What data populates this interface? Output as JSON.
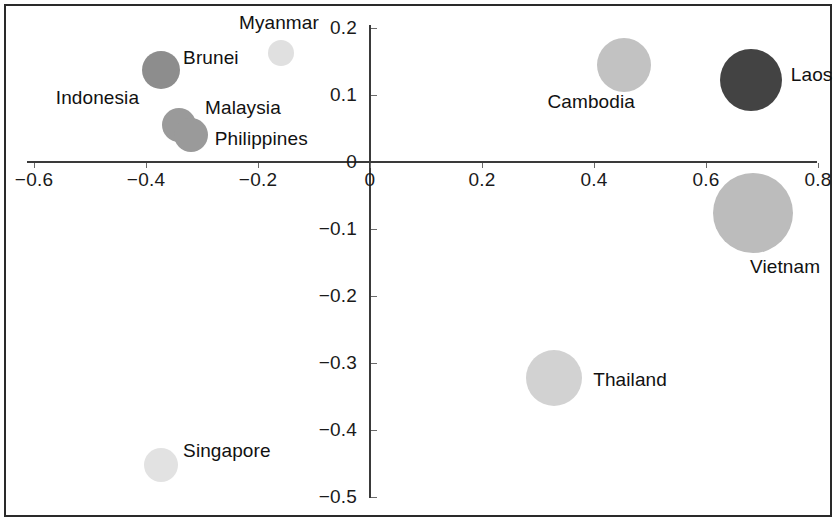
{
  "chart_data": {
    "type": "scatter",
    "title": "",
    "subtitle": "",
    "xlabel": "",
    "ylabel": "",
    "xlim": [
      -0.7,
      0.84
    ],
    "ylim": [
      -0.53,
      0.23
    ],
    "grid": false,
    "legend": "none",
    "xticks": [
      "-0.6",
      "-0.4",
      "-0.2",
      "0",
      "0.2",
      "0.4",
      "0.6",
      "0.8"
    ],
    "xtick_values": [
      -0.6,
      -0.4,
      -0.2,
      0,
      0.2,
      0.4,
      0.6,
      0.8
    ],
    "yticks": [
      "0.2",
      "0.1",
      "0",
      "-0.1",
      "-0.2",
      "-0.3",
      "-0.4",
      "-0.5"
    ],
    "ytick_values": [
      0.2,
      0.1,
      0,
      -0.1,
      -0.2,
      -0.3,
      -0.4,
      -0.5
    ],
    "origin_labels": {
      "x_zero": "0",
      "y_zero": "0"
    },
    "points": [
      {
        "name": "Indonesia",
        "x": -0.373,
        "y": 0.137,
        "size": 19,
        "color": "#8d8d8d",
        "label": "Indonesia",
        "label_anchor": "left",
        "label_dx": -22,
        "label_dy": 28
      },
      {
        "name": "Brunei",
        "x": -0.373,
        "y": 0.137,
        "size": 0,
        "color": "#8d8d8d",
        "label": "Brunei",
        "label_anchor": "right",
        "label_dx": 22,
        "label_dy": -12
      },
      {
        "name": "Myanmar",
        "x": -0.159,
        "y": 0.163,
        "size": 13,
        "color": "#e0e0e0",
        "label": "Myanmar",
        "label_anchor": "center",
        "label_dx": -2,
        "label_dy": -30
      },
      {
        "name": "Malaysia",
        "x": -0.341,
        "y": 0.055,
        "size": 17,
        "color": "#9a9a9a",
        "label": "Malaysia",
        "label_anchor": "right",
        "label_dx": 26,
        "label_dy": -17
      },
      {
        "name": "Philippines",
        "x": -0.32,
        "y": 0.04,
        "size": 17,
        "color": "#9a9a9a",
        "label": "Philippines",
        "label_anchor": "right",
        "label_dx": 24,
        "label_dy": 4
      },
      {
        "name": "Cambodia",
        "x": 0.454,
        "y": 0.145,
        "size": 27,
        "color": "#c2c2c2",
        "label": "Cambodia",
        "label_anchor": "center",
        "label_dx": -33,
        "label_dy": 37
      },
      {
        "name": "Laos",
        "x": 0.68,
        "y": 0.122,
        "size": 31,
        "color": "#434343",
        "label": "Laos",
        "label_anchor": "right",
        "label_dx": 40,
        "label_dy": -5
      },
      {
        "name": "Vietnam",
        "x": 0.684,
        "y": -0.076,
        "size": 40,
        "color": "#bcbcbc",
        "label": "Vietnam",
        "label_anchor": "center",
        "label_dx": 32,
        "label_dy": 54
      },
      {
        "name": "Thailand",
        "x": 0.329,
        "y": -0.322,
        "size": 28,
        "color": "#d2d2d2",
        "label": "Thailand",
        "label_anchor": "right",
        "label_dx": 39,
        "label_dy": 2
      },
      {
        "name": "Singapore",
        "x": -0.373,
        "y": -0.452,
        "size": 17,
        "color": "#e2e2e2",
        "label": "Singapore",
        "label_anchor": "right",
        "label_dx": 22,
        "label_dy": -14
      }
    ]
  },
  "colors": {
    "frame": "#2a2a2a",
    "axis": "#3a3a3a",
    "text": "#111111"
  }
}
